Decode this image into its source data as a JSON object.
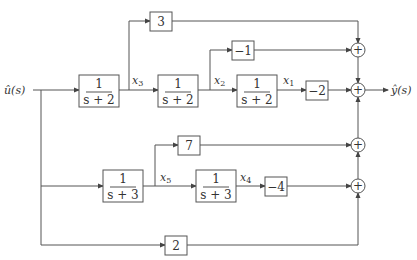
{
  "diagram": {
    "type": "block-diagram",
    "input_label": "û(s)",
    "output_label": "ŷ(s)",
    "blocks": [
      {
        "id": "tf1",
        "num": "1",
        "den": "s + 2"
      },
      {
        "id": "tf2",
        "num": "1",
        "den": "s + 2"
      },
      {
        "id": "tf3",
        "num": "1",
        "den": "s + 2"
      },
      {
        "id": "tf4",
        "num": "1",
        "den": "s + 3"
      },
      {
        "id": "tf5",
        "num": "1",
        "den": "s + 3"
      },
      {
        "id": "g3",
        "gain": "3"
      },
      {
        "id": "gm1",
        "gain": "−1"
      },
      {
        "id": "gm2",
        "gain": "−2"
      },
      {
        "id": "g7",
        "gain": "7"
      },
      {
        "id": "gm4",
        "gain": "−4"
      },
      {
        "id": "g2",
        "gain": "2"
      }
    ],
    "signals": {
      "x1": {
        "base": "x",
        "sub": "1"
      },
      "x2": {
        "base": "x",
        "sub": "2"
      },
      "x3": {
        "base": "x",
        "sub": "3"
      },
      "x4": {
        "base": "x",
        "sub": "4"
      },
      "x5": {
        "base": "x",
        "sub": "5"
      }
    },
    "summers": [
      {
        "id": "sum1",
        "symbol": "+"
      },
      {
        "id": "sum2",
        "symbol": "+"
      },
      {
        "id": "sum3",
        "symbol": "+"
      },
      {
        "id": "sum4",
        "symbol": "+"
      }
    ]
  }
}
